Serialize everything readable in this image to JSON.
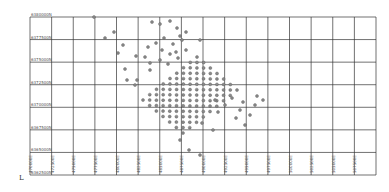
{
  "chart_data": {
    "type": "scatter",
    "title": "",
    "xlabel": "",
    "ylabel": "",
    "grid": true,
    "legend": null,
    "y_ticks": [
      "6380000N",
      "6377500N",
      "6375000N",
      "6372500N",
      "6370000N",
      "6367500N",
      "6365000N",
      "6362500N"
    ],
    "x_ticks": [
      "470000E",
      "472500E",
      "475000E",
      "477500E",
      "480000E",
      "482500E",
      "485000E",
      "487500E",
      "490000E",
      "492500E",
      "495000E",
      "497500E",
      "500000E",
      "502500E",
      "505000E",
      "507500E"
    ],
    "corner_mark": "L",
    "dense_grid": {
      "description": "regular lattice of sample points forming a rotated rectangle",
      "corners_px": [
        [
          197,
          57
        ],
        [
          233,
          92
        ],
        [
          183,
          133
        ],
        [
          143,
          100
        ]
      ],
      "spacing_px": 4.2
    },
    "scattered_points_px": [
      [
        94,
        17
      ],
      [
        105,
        38
      ],
      [
        114,
        32
      ],
      [
        118,
        53
      ],
      [
        123,
        45
      ],
      [
        125,
        69
      ],
      [
        127,
        80
      ],
      [
        152,
        22
      ],
      [
        160,
        24
      ],
      [
        170,
        21
      ],
      [
        173,
        44
      ],
      [
        177,
        28
      ],
      [
        180,
        36
      ],
      [
        164,
        38
      ],
      [
        156,
        43
      ],
      [
        162,
        50
      ],
      [
        170,
        54
      ],
      [
        176,
        52
      ],
      [
        186,
        32
      ],
      [
        182,
        40
      ],
      [
        148,
        47
      ],
      [
        136,
        56
      ],
      [
        145,
        57
      ],
      [
        150,
        70
      ],
      [
        137,
        80
      ],
      [
        135,
        85
      ],
      [
        150,
        63
      ],
      [
        160,
        60
      ],
      [
        168,
        64
      ],
      [
        178,
        58
      ],
      [
        186,
        50
      ],
      [
        200,
        40
      ],
      [
        215,
        100
      ],
      [
        225,
        105
      ],
      [
        232,
        98
      ],
      [
        240,
        110
      ],
      [
        243,
        102
      ],
      [
        250,
        115
      ],
      [
        236,
        118
      ],
      [
        218,
        112
      ],
      [
        213,
        130
      ],
      [
        202,
        123
      ],
      [
        180,
        140
      ],
      [
        189,
        150
      ],
      [
        200,
        155
      ],
      [
        245,
        125
      ],
      [
        255,
        105
      ],
      [
        263,
        100
      ],
      [
        257,
        96
      ]
    ]
  },
  "colors": {
    "grid": "#333333",
    "point": "#8a8a8a",
    "point_stroke": "#555555",
    "label": "#555555"
  }
}
